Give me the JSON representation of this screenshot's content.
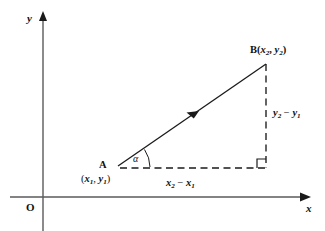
{
  "figure": {
    "background_color": "#ffffff",
    "line_color": "#1a1a1a",
    "axis_color": "#555555",
    "width": 325,
    "height": 231
  },
  "axes": {
    "x_label": "x",
    "y_label": "y",
    "origin_label": "O",
    "x_axis_y": 197,
    "y_axis_x": 43,
    "x_axis_start": 10,
    "x_axis_end": 312,
    "y_axis_top": 14,
    "y_axis_bottom": 231
  },
  "points": {
    "A": {
      "label": "A",
      "coords_open": "(",
      "coords_x": "x",
      "coords_x_sub": "1",
      "coords_sep": ", ",
      "coords_y": "y",
      "coords_y_sub": "1",
      "coords_close": ")",
      "coords_text": "(x1, y1)",
      "px": 114,
      "py": 167
    },
    "B": {
      "label": "B",
      "coords_open": "(",
      "coords_x": "x",
      "coords_x_sub": "2",
      "coords_sep": ", ",
      "coords_y": "y",
      "coords_y_sub": "2",
      "coords_close": ")",
      "coords_text": "B(x2, y2)",
      "px": 266,
      "py": 63
    }
  },
  "segments": {
    "horizontal": {
      "var": "x",
      "sub_b": "2",
      "minus": "−",
      "sub_a": "1",
      "text": "x2 − x1",
      "style": "dashed"
    },
    "vertical": {
      "var": "y",
      "sub_b": "2",
      "minus": "−",
      "sub_a": "1",
      "text": "y2 − y1",
      "style": "dashed"
    },
    "hypotenuse": {
      "style": "solid",
      "has_direction_arrow": true
    }
  },
  "angle": {
    "label": "α",
    "name": "alpha",
    "vertex": "A",
    "marker": "arc"
  },
  "right_angle": {
    "marker": "square",
    "size": 9,
    "corner_x": 266,
    "corner_y": 168
  }
}
